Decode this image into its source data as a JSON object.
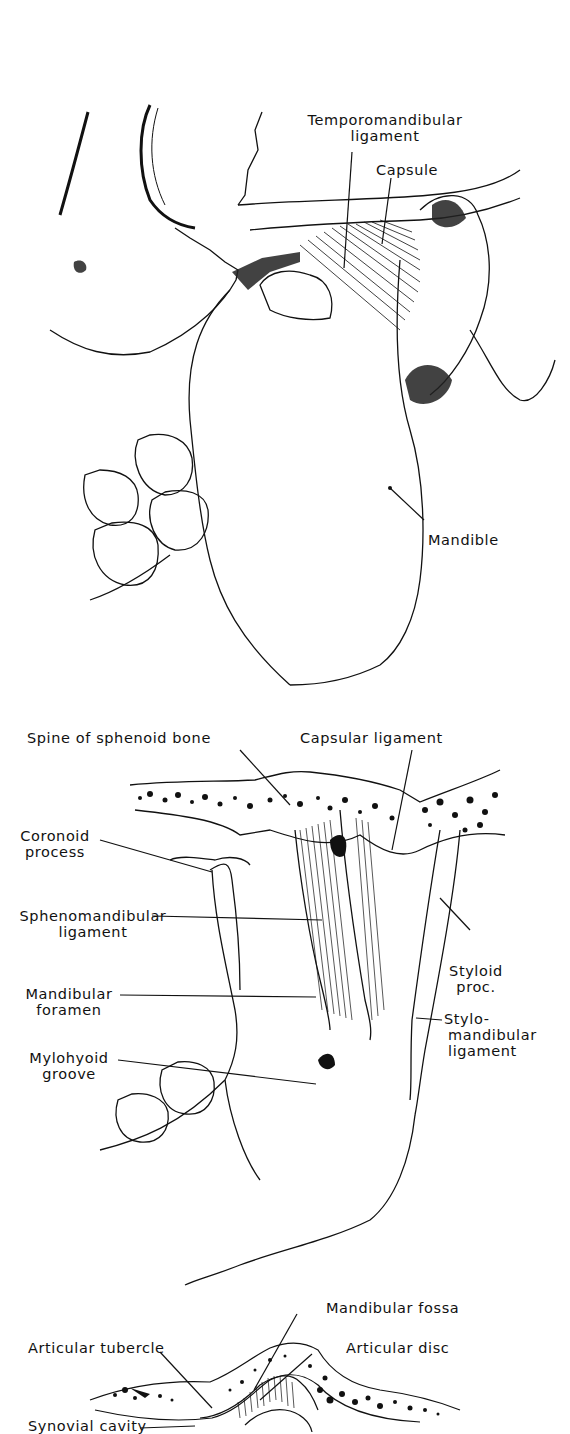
{
  "figures": [
    {
      "id": "lateral-view",
      "labels": {
        "temporomandibular_ligament": [
          "Temporomandibular",
          "ligament"
        ],
        "capsule": "Capsule",
        "mandible": "Mandible"
      }
    },
    {
      "id": "medial-view",
      "labels": {
        "spine_of_sphenoid": "Spine of sphenoid bone",
        "capsular_ligament": "Capsular ligament",
        "coronoid_process": [
          "Coronoid",
          "process"
        ],
        "sphenomandibular_ligament": [
          "Sphenomandibular",
          "ligament"
        ],
        "mandibular_foramen": [
          "Mandibular",
          "foramen"
        ],
        "mylohyoid_groove": [
          "Mylohyoid",
          "groove"
        ],
        "styloid_proc": [
          "Styloid",
          "proc."
        ],
        "stylomandibular_ligament": [
          "Stylo-",
          "mandibular",
          "ligament"
        ]
      }
    },
    {
      "id": "sagittal-section",
      "labels": {
        "mandibular_fossa": "Mandibular fossa",
        "articular_tubercle": "Articular tubercle",
        "articular_disc": "Articular disc",
        "synovial_cavity": "Synovial cavity"
      }
    }
  ],
  "colors": {
    "ink": "#111111",
    "paper": "#ffffff"
  }
}
